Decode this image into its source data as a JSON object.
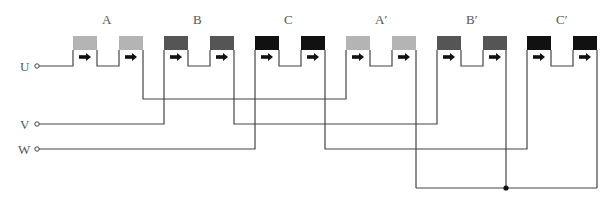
{
  "diagram": {
    "terminals": [
      {
        "label": "U",
        "y": 66
      },
      {
        "label": "V",
        "y": 124
      },
      {
        "label": "W",
        "y": 149
      }
    ],
    "coils": [
      {
        "label": "A",
        "x1": 73,
        "x2": 119,
        "color": "#b4b4b4"
      },
      {
        "label": "B",
        "x1": 164,
        "x2": 210,
        "color": "#555555"
      },
      {
        "label": "C",
        "x1": 255,
        "x2": 301,
        "color": "#111111"
      },
      {
        "label": "A′",
        "x1": 346,
        "x2": 392,
        "color": "#b4b4b4"
      },
      {
        "label": "B′",
        "x1": 437,
        "x2": 483,
        "color": "#555555"
      },
      {
        "label": "C′",
        "x1": 527,
        "x2": 573,
        "color": "#111111"
      }
    ],
    "arrow_glyph": "➡",
    "neutral_point": {
      "x": 506,
      "y": 188
    }
  }
}
